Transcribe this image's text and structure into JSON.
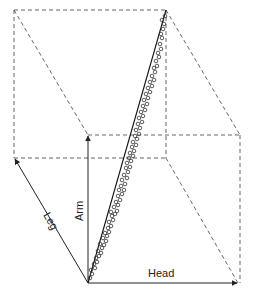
{
  "diagram": {
    "type": "3d-scatter-box",
    "axes": {
      "head": {
        "label": "Head"
      },
      "arm": {
        "label": "Arm"
      },
      "leg": {
        "label": "Leg"
      }
    },
    "colors": {
      "line": "#222222",
      "dashed": "#555555",
      "marker": "#333333",
      "background": "#ffffff"
    }
  },
  "chart_data": {
    "type": "scatter",
    "title": "",
    "dimensions": [
      "Head",
      "Arm",
      "Leg"
    ],
    "fit_line": {
      "from": [
        0,
        0,
        0
      ],
      "to": [
        1,
        1,
        1
      ]
    },
    "n_points_approx": 80,
    "points_screen": [
      [
        90,
        278
      ],
      [
        92,
        274
      ],
      [
        91,
        270
      ],
      [
        95,
        268
      ],
      [
        94,
        264
      ],
      [
        97,
        262
      ],
      [
        96,
        258
      ],
      [
        99,
        256
      ],
      [
        101,
        253
      ],
      [
        98,
        251
      ],
      [
        102,
        248
      ],
      [
        104,
        245
      ],
      [
        100,
        244
      ],
      [
        106,
        241
      ],
      [
        103,
        238
      ],
      [
        107,
        236
      ],
      [
        105,
        233
      ],
      [
        109,
        232
      ],
      [
        108,
        228
      ],
      [
        111,
        226
      ],
      [
        109,
        222
      ],
      [
        113,
        220
      ],
      [
        112,
        216
      ],
      [
        115,
        214
      ],
      [
        111,
        212
      ],
      [
        117,
        211
      ],
      [
        114,
        207
      ],
      [
        118,
        205
      ],
      [
        116,
        202
      ],
      [
        120,
        200
      ],
      [
        118,
        196
      ],
      [
        122,
        194
      ],
      [
        119,
        190
      ],
      [
        124,
        190
      ],
      [
        121,
        186
      ],
      [
        125,
        184
      ],
      [
        122,
        180
      ],
      [
        127,
        178
      ],
      [
        124,
        175
      ],
      [
        128,
        172
      ],
      [
        126,
        168
      ],
      [
        130,
        167
      ],
      [
        127,
        163
      ],
      [
        131,
        161
      ],
      [
        129,
        158
      ],
      [
        133,
        156
      ],
      [
        130,
        153
      ],
      [
        134,
        151
      ],
      [
        132,
        147
      ],
      [
        136,
        145
      ],
      [
        133,
        142
      ],
      [
        137,
        139
      ],
      [
        135,
        136
      ],
      [
        139,
        134
      ],
      [
        136,
        130
      ],
      [
        140,
        128
      ],
      [
        138,
        124
      ],
      [
        142,
        122
      ],
      [
        139,
        118
      ],
      [
        143,
        116
      ],
      [
        141,
        112
      ],
      [
        145,
        110
      ],
      [
        143,
        106
      ],
      [
        147,
        104
      ],
      [
        144,
        100
      ],
      [
        148,
        98
      ],
      [
        146,
        94
      ],
      [
        150,
        92
      ],
      [
        148,
        88
      ],
      [
        152,
        86
      ],
      [
        150,
        82
      ],
      [
        154,
        80
      ],
      [
        152,
        76
      ],
      [
        155,
        72
      ],
      [
        154,
        68
      ],
      [
        157,
        66
      ],
      [
        156,
        61
      ],
      [
        159,
        57
      ],
      [
        158,
        53
      ],
      [
        161,
        49
      ],
      [
        160,
        44
      ],
      [
        162,
        38
      ],
      [
        161,
        34
      ],
      [
        163,
        29
      ],
      [
        164,
        24
      ],
      [
        162,
        20
      ],
      [
        165,
        16
      ]
    ]
  }
}
